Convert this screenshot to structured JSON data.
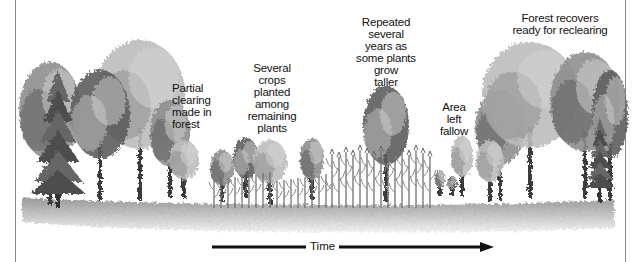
{
  "diagram": {
    "topic": "Shifting cultivation cycle",
    "stages": [
      {
        "id": "partial-clearing",
        "label": "Partial clearing made in forest"
      },
      {
        "id": "crops-planted",
        "label": "Several crops planted among remaining plants"
      },
      {
        "id": "repeated",
        "label": "Repeated several years as some plants grow taller"
      },
      {
        "id": "fallow",
        "label": "Area left fallow"
      },
      {
        "id": "forest-recovers",
        "label": "Forest recovers ready for reclearing"
      }
    ],
    "label_lines": {
      "partial_clearing": [
        "Partial",
        "clearing",
        "made in",
        "forest"
      ],
      "crops_planted": [
        "Several",
        "crops",
        "planted",
        "among",
        "remaining",
        "plants"
      ],
      "repeated": [
        "Repeated",
        "several",
        "years as",
        "some plants",
        "grow",
        "taller"
      ],
      "fallow": [
        "Area",
        "left",
        "fallow"
      ],
      "forest_recovers": [
        "Forest recovers",
        "ready for reclearing"
      ]
    },
    "axis": {
      "label": "Time",
      "direction": "left-to-right"
    },
    "colors": {
      "ink": "#111111",
      "foliage_dark": "#5c5c5c",
      "foliage_mid": "#8e8e8e",
      "foliage_light": "#bdbdbd",
      "ground": "#c8c8c8"
    }
  }
}
